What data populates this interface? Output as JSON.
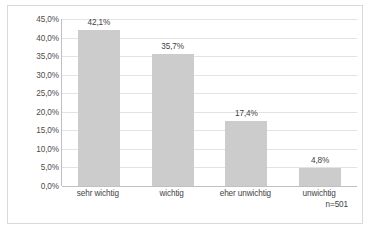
{
  "chart_data": {
    "type": "bar",
    "title": "",
    "xlabel": "",
    "ylabel": "",
    "categories": [
      "sehr wichtig",
      "wichtig",
      "eher unwichtig",
      "unwichtig"
    ],
    "values": [
      42.1,
      35.7,
      17.4,
      4.8
    ],
    "data_labels": [
      "42,1%",
      "35,7%",
      "17,4%",
      "4,8%"
    ],
    "ylim": [
      0,
      45
    ],
    "ytick_values": [
      0,
      5,
      10,
      15,
      20,
      25,
      30,
      35,
      40,
      45
    ],
    "ytick_labels": [
      "0,0%",
      "5,0%",
      "10,0%",
      "15,0%",
      "20,0%",
      "25,0%",
      "30,0%",
      "35,0%",
      "40,0%",
      "45,0%"
    ],
    "grid": true,
    "legend": "none",
    "bar_color": "#cccccc",
    "gridline_color": "#e3e3e3",
    "axis_color": "#c0c0c0",
    "annotation": "n=501"
  },
  "frame": {
    "border_color": "#d9d9d9"
  }
}
